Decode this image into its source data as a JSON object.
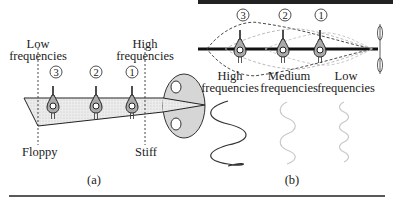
{
  "panel_a": {
    "caption": "(a)",
    "low_freq_label": [
      "Low",
      "frequencies"
    ],
    "high_freq_label": [
      "High",
      "frequencies"
    ],
    "floppy_label": "Floppy",
    "stiff_label": "Stiff",
    "markers": [
      "3",
      "2",
      "1"
    ]
  },
  "panel_b": {
    "caption": "(b)",
    "markers": [
      "3",
      "2",
      "1"
    ],
    "wave_labels": [
      {
        "line1": "High",
        "line2": "frequencies"
      },
      {
        "line1": "Medium",
        "line2": "frequencies"
      },
      {
        "line1": "Low",
        "line2": "frequencies"
      }
    ]
  },
  "colors": {
    "ink": "#222222",
    "membrane_fill": "#e4e4e4",
    "oval_fill": "#d6d6d6",
    "light_wave": "#c8c8c8"
  }
}
